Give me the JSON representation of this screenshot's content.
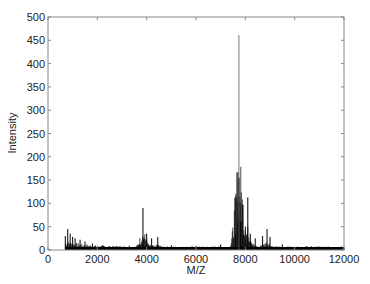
{
  "chart_data": {
    "type": "line",
    "title": "",
    "xlabel": "M/Z",
    "ylabel": "Intensity",
    "xlim": [
      0,
      12000
    ],
    "ylim": [
      0,
      500
    ],
    "xticks": [
      0,
      2000,
      4000,
      6000,
      8000,
      10000,
      12000
    ],
    "yticks": [
      0,
      50,
      100,
      150,
      200,
      250,
      300,
      350,
      400,
      450,
      500
    ],
    "grid": false,
    "legend": null,
    "series": [
      {
        "name": "spectrum",
        "color": "#000000",
        "peaks": [
          {
            "mz": 700,
            "intensity": 30
          },
          {
            "mz": 800,
            "intensity": 45
          },
          {
            "mz": 900,
            "intensity": 35
          },
          {
            "mz": 1000,
            "intensity": 28
          },
          {
            "mz": 1100,
            "intensity": 25
          },
          {
            "mz": 1300,
            "intensity": 22
          },
          {
            "mz": 1500,
            "intensity": 18
          },
          {
            "mz": 1800,
            "intensity": 14
          },
          {
            "mz": 2200,
            "intensity": 10
          },
          {
            "mz": 2800,
            "intensity": 8
          },
          {
            "mz": 3300,
            "intensity": 9
          },
          {
            "mz": 3700,
            "intensity": 12
          },
          {
            "mz": 3850,
            "intensity": 90
          },
          {
            "mz": 4000,
            "intensity": 35
          },
          {
            "mz": 4200,
            "intensity": 25
          },
          {
            "mz": 4450,
            "intensity": 28
          },
          {
            "mz": 5000,
            "intensity": 10
          },
          {
            "mz": 6000,
            "intensity": 8
          },
          {
            "mz": 7000,
            "intensity": 12
          },
          {
            "mz": 7600,
            "intensity": 35
          },
          {
            "mz": 7700,
            "intensity": 167
          },
          {
            "mz": 7740,
            "intensity": 461
          },
          {
            "mz": 7800,
            "intensity": 60
          },
          {
            "mz": 7900,
            "intensity": 97
          },
          {
            "mz": 8000,
            "intensity": 50
          },
          {
            "mz": 8100,
            "intensity": 113
          },
          {
            "mz": 8200,
            "intensity": 35
          },
          {
            "mz": 8400,
            "intensity": 25
          },
          {
            "mz": 8700,
            "intensity": 30
          },
          {
            "mz": 8880,
            "intensity": 45
          },
          {
            "mz": 9000,
            "intensity": 28
          },
          {
            "mz": 9500,
            "intensity": 12
          },
          {
            "mz": 10500,
            "intensity": 8
          },
          {
            "mz": 11500,
            "intensity": 6
          },
          {
            "mz": 12000,
            "intensity": 5
          }
        ]
      }
    ]
  }
}
